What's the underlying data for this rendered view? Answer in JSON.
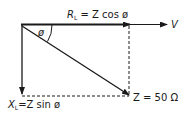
{
  "diagram": {
    "type": "impedance-phasor-diagram",
    "labels": {
      "resistance": {
        "main": "R",
        "sub": "L",
        "rest": " = Z cos ø"
      },
      "reactance": {
        "main": "X",
        "sub": "L",
        "rest": "=Z  sin  ø"
      },
      "impedance": "Z = 50 Ω",
      "voltage": "V",
      "angle": "ø"
    },
    "colors": {
      "line": "#1a1a1a",
      "background": "#ffffff"
    }
  }
}
